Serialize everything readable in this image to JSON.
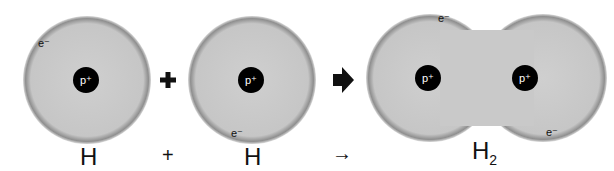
{
  "diagram": {
    "type": "reaction",
    "atoms": [
      {
        "label": "H",
        "proton": "p⁺",
        "electron": "e⁻"
      },
      {
        "label": "H",
        "proton": "p⁺",
        "electron": "e⁻"
      }
    ],
    "molecule": {
      "label": "H",
      "subscript": "2",
      "protons": [
        "p⁺",
        "p⁺"
      ],
      "electrons": [
        "e⁻",
        "e⁻"
      ]
    },
    "operators": {
      "plus_big": "+",
      "plus_small": "+",
      "arrow_small": "→"
    },
    "colors": {
      "cloud": "#c8c8c8",
      "rim": "#8e8e8e",
      "proton": "#000000"
    }
  }
}
